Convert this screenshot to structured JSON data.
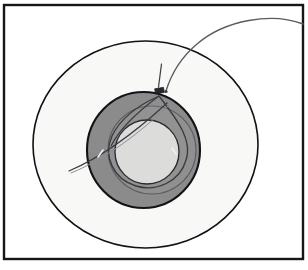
{
  "figure": {
    "canvas": {
      "width": 308,
      "height": 270
    },
    "background_color": "#ffffff"
  },
  "frame": {
    "name": "image-border",
    "x": 4,
    "y": 5,
    "width": 299,
    "height": 254,
    "stroke_color": "#15161a",
    "stroke_width": 2.2,
    "fill": "#ffffff"
  },
  "shapes": {
    "outer_circle": {
      "label": "outer-boundary-circle",
      "cx": 145.5,
      "cy": 144.5,
      "rx": 112.5,
      "ry": 103.5,
      "fill_color": "#f8f8f7",
      "stroke_color": "#111216",
      "stroke_width": 1.5
    },
    "annulus_ring": {
      "label": "dark-gray-annulus",
      "cx": 143.5,
      "cy": 150,
      "rx": 56.5,
      "ry": 58,
      "fill_color": "#8b8b8b",
      "stroke_color": "#121317",
      "stroke_width": 2.0
    },
    "inner_disc": {
      "label": "light-inner-disc",
      "cx": 147,
      "cy": 152,
      "rx": 32,
      "ry": 32,
      "fill_color": "#dcdcdb",
      "stroke_color": "#2a2b2f",
      "stroke_width": 1.3
    },
    "ghost_circle": {
      "label": "offset-ghost-circle",
      "cx": 152,
      "cy": 150,
      "rx": 44,
      "ry": 44,
      "fill_color": "rgba(130,130,130,0.30)",
      "stroke_color": "#5d5e62",
      "stroke_width": 1.1
    },
    "teardrop": {
      "label": "teardrop-outline",
      "apex_x": 159,
      "apex_y": 96,
      "fill_color": "rgba(160,160,160,0.16)",
      "stroke_color": "#3a3b40",
      "stroke_width": 1.3
    }
  },
  "annotations": {
    "marker": {
      "label": "dark-rectangular-marker",
      "x": 155,
      "y": 88,
      "width": 9,
      "height": 5,
      "rotation_deg": -10,
      "color": "#26272b"
    },
    "pointer_line": {
      "label": "straight-pointer-line",
      "x1": 161,
      "y1": 65,
      "x2": 158,
      "y2": 88,
      "color": "#3f4045",
      "stroke_width": 1.2
    },
    "leader_curve": {
      "label": "curved-leader-line",
      "from_x": 303,
      "from_y": 22,
      "to_x": 165,
      "to_y": 92,
      "color": "#5a5b60",
      "stroke_width": 1.3
    },
    "diagonal_line": {
      "label": "diagonal-cross-line",
      "x1": 69,
      "y1": 170,
      "x2": 167,
      "y2": 104,
      "color": "#3b3c41",
      "stroke_width": 1.2
    },
    "tick_mark": {
      "label": "small-tick-on-diagonal",
      "x": 100,
      "y": 152,
      "color": "#ffffff"
    }
  }
}
